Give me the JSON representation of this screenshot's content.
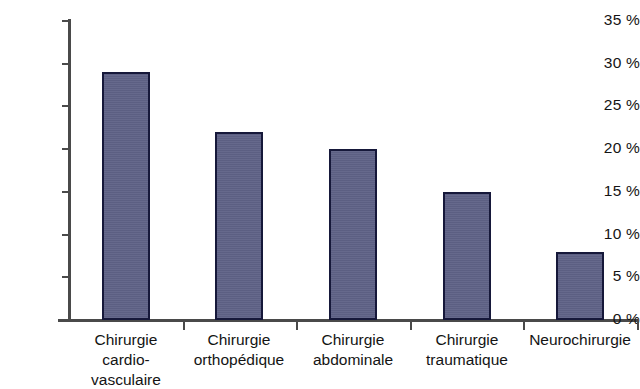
{
  "chart_data": {
    "type": "bar",
    "title": "",
    "subtitle": "",
    "xlabel": "",
    "ylabel": "",
    "categories": [
      "Chirurgie\ncardio-\nvasculaire",
      "Chirurgie\northopédique",
      "Chirurgie\nabdominale",
      "Chirurgie\ntraumatique",
      "Neurochirurgie"
    ],
    "values": [
      29,
      22,
      20,
      15,
      8
    ],
    "value_unit": "%",
    "ylim": [
      0,
      35
    ],
    "ytick_values": [
      0,
      5,
      10,
      15,
      20,
      25,
      30,
      35
    ],
    "ytick_labels": [
      "0 %",
      "5 %",
      "10 %",
      "15 %",
      "20 %",
      "25 %",
      "30 %",
      "35 %"
    ],
    "grid": false,
    "legend": null,
    "bar_color": "#5f6287",
    "bar_border_color": "#16183a",
    "axis_color": "#4a4a4a"
  }
}
